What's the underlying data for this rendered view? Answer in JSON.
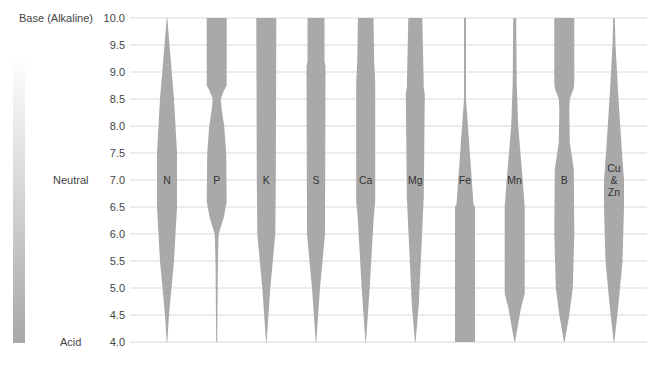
{
  "chart_data": {
    "type": "area",
    "title": "",
    "subtitle": "Nutrient availability by soil pH",
    "xlabel": "",
    "ylabel": "pH",
    "ylim": [
      4.0,
      10.0
    ],
    "yticks": [
      "4.0",
      "4.5",
      "5.0",
      "5.5",
      "6.0",
      "6.5",
      "7.0",
      "7.5",
      "8.0",
      "8.5",
      "9.0",
      "9.5",
      "10.0"
    ],
    "side_labels": {
      "top": "Base (Alkaline)",
      "middle": "Neutral",
      "bottom": "Acid"
    },
    "grid": true,
    "bar_color": "#a9a9a9",
    "grid_color": "#d9d9d9",
    "gradient": {
      "top_color": "#ffffff",
      "bottom_color": "#a8a8a8"
    },
    "width_unit": "relative availability 0-1",
    "series": [
      {
        "name": "N",
        "label": [
          "N"
        ],
        "profile": [
          [
            4.0,
            0.0
          ],
          [
            4.5,
            0.2
          ],
          [
            5.5,
            0.7
          ],
          [
            6.5,
            1.0
          ],
          [
            7.5,
            1.0
          ],
          [
            8.5,
            0.7
          ],
          [
            9.5,
            0.25
          ],
          [
            10.0,
            0.0
          ]
        ]
      },
      {
        "name": "P",
        "label": [
          "P"
        ],
        "profile": [
          [
            4.0,
            0.05
          ],
          [
            5.5,
            0.12
          ],
          [
            6.0,
            0.2
          ],
          [
            6.3,
            0.7
          ],
          [
            6.6,
            1.0
          ],
          [
            7.5,
            0.95
          ],
          [
            8.0,
            0.75
          ],
          [
            8.3,
            0.5
          ],
          [
            8.5,
            0.4
          ],
          [
            8.65,
            0.7
          ],
          [
            8.75,
            1.0
          ],
          [
            10.0,
            1.0
          ]
        ]
      },
      {
        "name": "K",
        "label": [
          "K"
        ],
        "profile": [
          [
            4.0,
            0.0
          ],
          [
            5.0,
            0.4
          ],
          [
            6.0,
            0.9
          ],
          [
            7.0,
            0.95
          ],
          [
            10.0,
            1.0
          ]
        ]
      },
      {
        "name": "S",
        "label": [
          "S"
        ],
        "profile": [
          [
            4.0,
            0.0
          ],
          [
            5.0,
            0.4
          ],
          [
            6.0,
            0.9
          ],
          [
            9.1,
            0.95
          ],
          [
            9.2,
            0.85
          ],
          [
            10.0,
            0.85
          ]
        ]
      },
      {
        "name": "Ca",
        "label": [
          "Ca"
        ],
        "profile": [
          [
            4.0,
            0.0
          ],
          [
            5.0,
            0.4
          ],
          [
            6.3,
            0.8
          ],
          [
            6.6,
            0.95
          ],
          [
            8.8,
            0.95
          ],
          [
            9.2,
            0.85
          ],
          [
            10.0,
            0.78
          ]
        ]
      },
      {
        "name": "Mg",
        "label": [
          "Mg"
        ],
        "profile": [
          [
            4.0,
            0.0
          ],
          [
            4.7,
            0.35
          ],
          [
            6.7,
            0.85
          ],
          [
            8.6,
            0.95
          ],
          [
            8.7,
            0.85
          ],
          [
            10.0,
            0.7
          ]
        ]
      },
      {
        "name": "Fe",
        "label": [
          "Fe"
        ],
        "profile": [
          [
            4.0,
            1.0
          ],
          [
            6.5,
            1.0
          ],
          [
            6.55,
            0.85
          ],
          [
            8.5,
            0.1
          ],
          [
            8.65,
            0.1
          ],
          [
            10.0,
            0.1
          ]
        ]
      },
      {
        "name": "Mn",
        "label": [
          "Mn"
        ],
        "profile": [
          [
            4.0,
            0.0
          ],
          [
            4.6,
            0.6
          ],
          [
            4.9,
            1.0
          ],
          [
            6.5,
            1.0
          ],
          [
            7.0,
            0.8
          ],
          [
            8.0,
            0.35
          ],
          [
            8.8,
            0.2
          ],
          [
            10.0,
            0.15
          ]
        ]
      },
      {
        "name": "B",
        "label": [
          "B"
        ],
        "profile": [
          [
            4.0,
            0.0
          ],
          [
            4.5,
            0.5
          ],
          [
            5.0,
            0.85
          ],
          [
            6.0,
            1.0
          ],
          [
            7.2,
            0.95
          ],
          [
            7.7,
            0.55
          ],
          [
            8.3,
            0.5
          ],
          [
            8.5,
            0.55
          ],
          [
            8.7,
            0.95
          ],
          [
            8.8,
            1.0
          ],
          [
            10.0,
            1.0
          ]
        ]
      },
      {
        "name": "Cu & Zn",
        "label": [
          "Cu",
          "&",
          "Zn"
        ],
        "profile": [
          [
            4.0,
            0.0
          ],
          [
            4.7,
            0.45
          ],
          [
            5.5,
            0.85
          ],
          [
            6.5,
            1.0
          ],
          [
            7.0,
            1.0
          ],
          [
            7.5,
            0.8
          ],
          [
            8.5,
            0.45
          ],
          [
            9.5,
            0.15
          ],
          [
            10.0,
            0.08
          ]
        ]
      }
    ]
  }
}
